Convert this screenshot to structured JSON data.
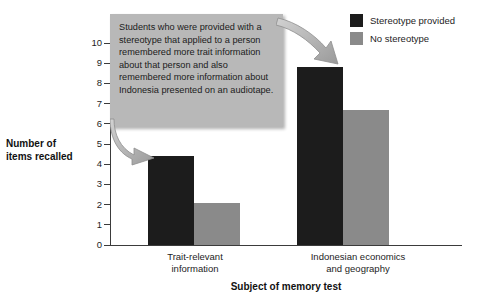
{
  "chart_data": {
    "type": "bar",
    "title": "",
    "xlabel": "Subject of memory test",
    "ylabel": "Number of\nitems recalled",
    "categories": [
      "Trait-relevant information",
      "Indonesian economics and geography"
    ],
    "series": [
      {
        "name": "Stereotype provided",
        "color": "#1c1c1c",
        "values": [
          4.4,
          8.8
        ]
      },
      {
        "name": "No stereotype",
        "color": "#8a8a8a",
        "values": [
          2.1,
          6.7
        ]
      }
    ],
    "ylim": [
      0,
      10
    ],
    "yticks": [
      0,
      1,
      2,
      3,
      4,
      5,
      6,
      7,
      8,
      9,
      10
    ],
    "ytick_labels": [
      "0",
      "1",
      "2",
      "3",
      "4",
      "5",
      "6",
      "7",
      "8",
      "9",
      "10"
    ],
    "grid": false,
    "legend_position": "top-right",
    "annotations": [
      {
        "text": "Students who were provided with a stereotype that applied to a person remembered more trait information about that person and also remembered more information about Indonesia presented on an audiotape.",
        "points_to": [
          "Trait-relevant information / Stereotype provided bar",
          "Indonesian economics and geography / Stereotype provided bar"
        ]
      }
    ]
  },
  "axes": {
    "y_title_line1": "Number of",
    "y_title_line2": "items recalled",
    "x_title": "Subject of memory test"
  },
  "category_labels": [
    {
      "line1": "Trait-relevant",
      "line2": "information"
    },
    {
      "line1": "Indonesian economics",
      "line2": "and geography"
    }
  ],
  "legend": {
    "items": [
      {
        "label": "Stereotype provided",
        "color": "#1c1c1c"
      },
      {
        "label": "No stereotype",
        "color": "#8a8a8a"
      }
    ]
  },
  "callout": {
    "text": "Students who were provided with a stereotype that applied to a person remembered more trait information about that person and also remembered more information about Indonesia presented on an audiotape.",
    "background": "#b8b8b8"
  },
  "colors": {
    "dark_series": "#1c1c1c",
    "light_series": "#8a8a8a",
    "axis": "#3b3b3b",
    "text": "#1d1d1d",
    "background": "#ffffff"
  }
}
